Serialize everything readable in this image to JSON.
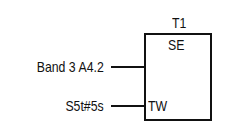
{
  "block": {
    "name": "T1",
    "type": "SE",
    "inputs": [
      {
        "pin": "",
        "signal": "Band 3  A4.2"
      },
      {
        "pin": "TW",
        "signal": "S5t#5s"
      }
    ]
  }
}
